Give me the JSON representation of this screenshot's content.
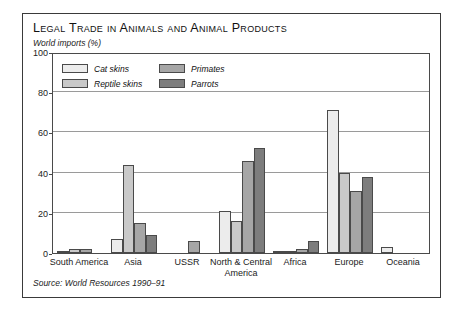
{
  "figure": {
    "title": "Legal Trade in Animals and Animal Products",
    "subtitle": "World imports (%)",
    "source": "Source: World Resources 1990–91"
  },
  "legend": {
    "items": [
      {
        "label": "Cat skins",
        "color": "#ececec"
      },
      {
        "label": "Reptile skins",
        "color": "#c9c9c9"
      },
      {
        "label": "Primates",
        "color": "#a6a6a6"
      },
      {
        "label": "Parrots",
        "color": "#7d7d7d"
      }
    ]
  },
  "axis": {
    "y_ticks": [
      "0",
      "20",
      "40",
      "60",
      "80",
      "100"
    ],
    "x_labels": [
      "South America",
      "Asia",
      "USSR",
      "North & Central America",
      "Africa",
      "Europe",
      "Oceania"
    ]
  },
  "chart_data": {
    "type": "bar",
    "title": "Legal Trade in Animals and Animal Products",
    "subtitle": "World imports (%)",
    "xlabel": "",
    "ylabel": "World imports (%)",
    "ylim": [
      0,
      100
    ],
    "yticks": [
      0,
      20,
      40,
      60,
      80,
      100
    ],
    "grid": true,
    "legend_position": "inside-top-left",
    "categories": [
      "South America",
      "Asia",
      "USSR",
      "North & Central America",
      "Africa",
      "Europe",
      "Oceania"
    ],
    "series": [
      {
        "name": "Cat skins",
        "color": "#ececec",
        "values": [
          1,
          7,
          0,
          21,
          1,
          71,
          3
        ]
      },
      {
        "name": "Reptile skins",
        "color": "#c9c9c9",
        "values": [
          2,
          44,
          0,
          16,
          1,
          40,
          0
        ]
      },
      {
        "name": "Primates",
        "color": "#a6a6a6",
        "values": [
          2,
          15,
          6,
          46,
          2,
          31,
          0
        ]
      },
      {
        "name": "Parrots",
        "color": "#7d7d7d",
        "values": [
          0,
          9,
          0,
          52,
          6,
          38,
          0
        ]
      }
    ],
    "source": "Source: World Resources 1990–91"
  }
}
